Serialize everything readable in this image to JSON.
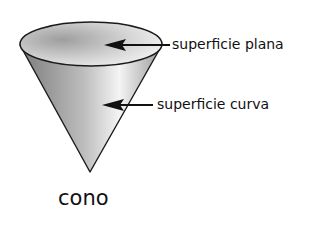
{
  "diagram": {
    "shape": "cone",
    "title": "cono",
    "labels": {
      "flat_surface": "superficie plana",
      "curved_surface": "superficie curva"
    },
    "colors": {
      "outline": "#1a1a1a",
      "fill_dark": "#8a8a8a",
      "fill_light": "#f2f2f2",
      "text": "#111111"
    }
  }
}
